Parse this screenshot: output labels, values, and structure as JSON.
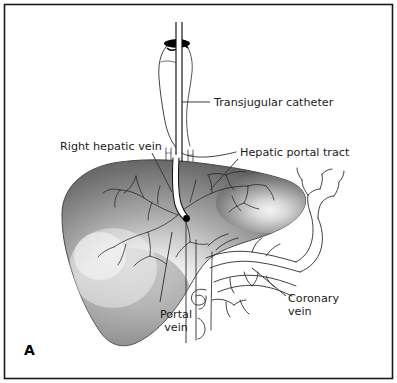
{
  "figure": {
    "panel_letter": "A",
    "background_color": "#ffffff",
    "border_color": "#1a1a1a"
  },
  "labels": [
    {
      "id": "transjugular-catheter",
      "text": "Transjugular catheter",
      "x": 214,
      "y": 106,
      "anchor": "start",
      "lines": [
        "Transjugular catheter"
      ]
    },
    {
      "id": "right-hepatic-vein",
      "text": "Right hepatic vein",
      "x": 60,
      "y": 150,
      "anchor": "start",
      "lines": [
        "Right hepatic vein"
      ]
    },
    {
      "id": "hepatic-portal-tract",
      "text": "Hepatic portal tract",
      "x": 240,
      "y": 156,
      "anchor": "start",
      "lines": [
        "Hepatic portal tract"
      ]
    },
    {
      "id": "portal-vein",
      "text": "Portal vein",
      "x": 176,
      "y": 318,
      "anchor": "middle",
      "lines": [
        "Portal",
        "vein"
      ]
    },
    {
      "id": "coronary-vein",
      "text": "Coronary vein",
      "x": 288,
      "y": 302,
      "anchor": "start",
      "lines": [
        "Coronary",
        "vein"
      ]
    }
  ],
  "structures": {
    "liver": {
      "name": "liver",
      "shading": "radial-gradient",
      "highlight_color": "#fdfdfd",
      "midtone_color": "#9a9a9a",
      "edge_color": "#4e4e4e"
    },
    "catheter": {
      "name": "transjugular-catheter",
      "fill_color": "#ffffff",
      "outline_color": "#111111",
      "tip_marker": "black-dot"
    },
    "vena_cava": {
      "name": "inferior-vena-cava",
      "outline_color": "#111111"
    },
    "jugular_entry": {
      "name": "vein-entry-opening",
      "fill_color": "#000000"
    },
    "coronary_vein": {
      "name": "coronary-vein-varices",
      "outline_color": "#2b2b2b"
    },
    "portal_vein": {
      "name": "portal-vein",
      "outline_color": "#2b2b2b"
    }
  }
}
